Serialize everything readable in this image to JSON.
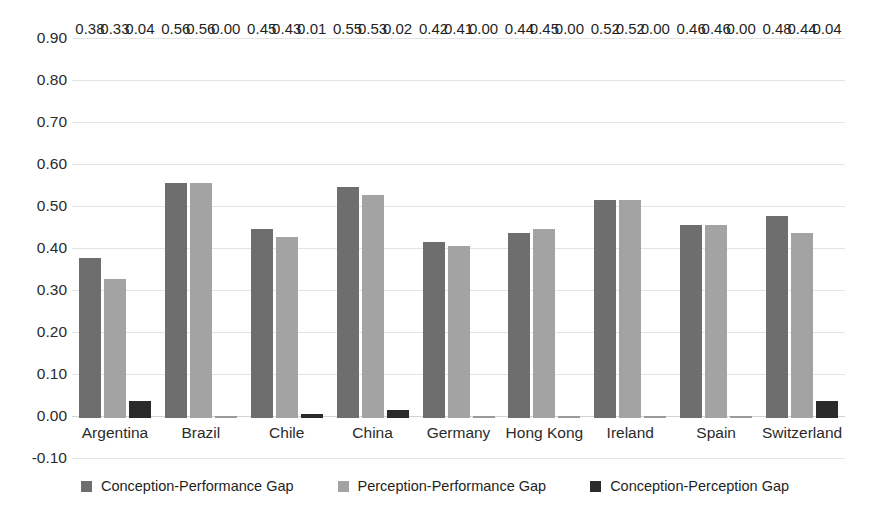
{
  "chart_data": {
    "type": "bar",
    "title": "",
    "subtitle": "",
    "xlabel": "",
    "ylabel": "",
    "ylim": [
      -0.1,
      0.9
    ],
    "ytick_step": 0.1,
    "grid": true,
    "legend_position": "bottom",
    "categories": [
      "Argentina",
      "Brazil",
      "Chile",
      "China",
      "Germany",
      "Hong Kong",
      "Ireland",
      "Spain",
      "Switzerland"
    ],
    "ytick_labels": [
      "0.90",
      "0.80",
      "0.70",
      "0.60",
      "0.50",
      "0.40",
      "0.30",
      "0.20",
      "0.10",
      "0.00",
      "-0.10"
    ],
    "ytick_values": [
      0.9,
      0.8,
      0.7,
      0.6,
      0.5,
      0.4,
      0.3,
      0.2,
      0.1,
      0.0,
      -0.1
    ],
    "series": [
      {
        "name": "Conception-Performance Gap",
        "color": "#6e6e6e",
        "values": [
          0.38,
          0.56,
          0.45,
          0.55,
          0.42,
          0.44,
          0.52,
          0.46,
          0.48
        ],
        "labels": [
          "0.38",
          "0.56",
          "0.45",
          "0.55",
          "0.42",
          "0.44",
          "0.52",
          "0.46",
          "0.48"
        ]
      },
      {
        "name": "Perception-Performance Gap",
        "color": "#a3a3a3",
        "values": [
          0.33,
          0.56,
          0.43,
          0.53,
          0.41,
          0.45,
          0.52,
          0.46,
          0.44
        ],
        "labels": [
          "0.33",
          "0.56",
          "0.43",
          "0.53",
          "0.41",
          "0.45",
          "0.52",
          "0.46",
          "0.44"
        ]
      },
      {
        "name": "Conception-Perception Gap",
        "color": "#2b2b2b",
        "values": [
          0.04,
          0.0,
          0.01,
          0.02,
          0.0,
          0.0,
          0.0,
          0.0,
          0.04
        ],
        "labels": [
          "0.04",
          "0.00",
          "0.01",
          "0.02",
          "0.00",
          "0.00",
          "0.00",
          "0.00",
          "0.04"
        ]
      }
    ]
  },
  "legend": {
    "items": [
      {
        "label": "Conception-Performance Gap",
        "color": "#6e6e6e"
      },
      {
        "label": "Perception-Performance Gap",
        "color": "#a3a3a3"
      },
      {
        "label": "Conception-Perception Gap",
        "color": "#2b2b2b"
      }
    ]
  }
}
